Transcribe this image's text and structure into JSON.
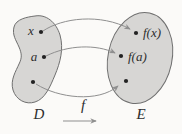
{
  "figure": {
    "type": "function-mapping-diagram",
    "colors": {
      "background": "#fbfaf8",
      "set_fill": "#d7d6d4",
      "set_stroke": "#6f6f6f",
      "arrow": "#8f8f8f",
      "dot": "#222222",
      "text": "#2e2e2e"
    },
    "domain_label": "D",
    "codomain_label": "E",
    "function_label": "f",
    "mappings": [
      {
        "from": "x",
        "to": "f(x)"
      },
      {
        "from": "a",
        "to": "f(a)"
      },
      {
        "from": "",
        "to": ""
      }
    ]
  }
}
